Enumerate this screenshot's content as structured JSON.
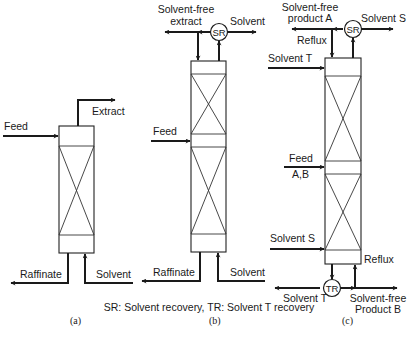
{
  "figure": {
    "legend": "SR: Solvent recovery, TR: Solvent T recovery",
    "panels": [
      {
        "id": "a",
        "caption": "(a)",
        "labels": {
          "feed": "Feed",
          "extract": "Extract",
          "raffinate": "Raffinate",
          "solvent": "Solvent"
        }
      },
      {
        "id": "b",
        "caption": "(b)",
        "labels": {
          "solvent_free_extract_1": "Solvent-free",
          "solvent_free_extract_2": "extract",
          "solvent": "Solvent",
          "sr": "SR",
          "feed": "Feed",
          "raffinate": "Raffinate",
          "solvent_bottom": "Solvent"
        }
      },
      {
        "id": "c",
        "caption": "(c)",
        "labels": {
          "product_a_1": "Solvent-free",
          "product_a_2": "product A",
          "solvent_s_top": "Solvent S",
          "sr": "SR",
          "reflux_top": "Reflux",
          "solvent_t_top": "Solvent T",
          "feed_1": "Feed",
          "feed_2": "A,B",
          "solvent_s": "Solvent S",
          "tr": "TR",
          "reflux_bottom": "Reflux",
          "solvent_t_bottom": "Solvent T",
          "product_b_1": "Solvent-free",
          "product_b_2": "Product B"
        }
      }
    ]
  }
}
